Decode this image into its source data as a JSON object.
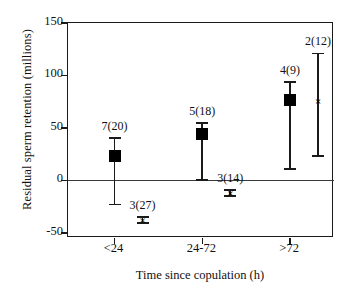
{
  "chart_data": {
    "type": "scatter",
    "title": "",
    "xlabel": "Time since copulation (h)",
    "ylabel": "Residual sperm retention (millions)",
    "categories": [
      "<24",
      "24-72",
      ">72"
    ],
    "yticks": [
      150,
      100,
      50,
      0,
      -50
    ],
    "ylim": [
      -55,
      150
    ],
    "grid": false,
    "legend": null,
    "zero_reference_line": 0,
    "series": [
      {
        "name": "filled-square",
        "marker": "square",
        "points": [
          {
            "group": "<24",
            "label": "7(20)",
            "n_males": 7,
            "n_obs": 20,
            "value": 23,
            "err_low": -23,
            "err_high": 40
          },
          {
            "group": "24-72",
            "label": "5(18)",
            "n_males": 5,
            "n_obs": 18,
            "value": 44,
            "err_low": 0,
            "err_high": 55
          },
          {
            "group": ">72",
            "label": "4(9)",
            "n_males": 4,
            "n_obs": 9,
            "value": 77,
            "err_low": 11,
            "err_high": 94
          }
        ]
      },
      {
        "name": "cross",
        "marker": "x",
        "points": [
          {
            "group": "<24",
            "label": "3(27)",
            "n_males": 3,
            "n_obs": 27,
            "value": -38,
            "err_low": -41,
            "err_high": -35
          },
          {
            "group": "24-72",
            "label": "3(14)",
            "n_males": 3,
            "n_obs": 14,
            "value": -12,
            "err_low": -15,
            "err_high": -9
          },
          {
            "group": ">72",
            "label": "2(12)",
            "n_males": 2,
            "n_obs": 12,
            "value": 76,
            "err_low": 23,
            "err_high": 121
          }
        ]
      }
    ]
  },
  "axis": {
    "ytick_labels": [
      "150",
      "100",
      "50",
      "0",
      "-50"
    ],
    "xtick_labels": [
      "<24",
      "24-72",
      ">72"
    ],
    "x_title": "Time since copulation (h)",
    "y_title": "Residual sperm retention (millions)"
  },
  "colors": {
    "axis": "#1a1a1a",
    "marker": "#000000",
    "zero_line": "#3a3a3a",
    "background": "#ffffff"
  }
}
